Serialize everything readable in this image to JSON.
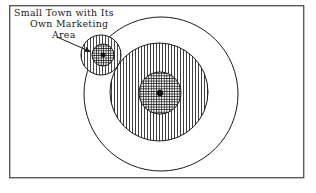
{
  "figure": {
    "background_color": "#ffffff",
    "ink_color": "#1a1a1a",
    "frame": {
      "label": "diagram-border",
      "x": 9,
      "y": 5,
      "width": 295,
      "height": 173,
      "stroke_color": "#5a5a5a",
      "stroke_width": 1.4
    },
    "annotation": {
      "lines": [
        "Small Town  with Its",
        "Own Marketing",
        "Area"
      ],
      "line_x": [
        14,
        30,
        52
      ],
      "line_y": [
        16,
        27,
        38
      ],
      "font_size": 9.4,
      "color": "#1a1a1a"
    },
    "leader_arrow": {
      "label": "pointer-arrow",
      "from_x": 57,
      "from_y": 37,
      "to_x": 93,
      "to_y": 53,
      "stroke_color": "#1a1a1a",
      "stroke_width": 1.0
    },
    "shapes": [
      {
        "name": "outer-trade-area-circle",
        "role": "outer marketing boundary",
        "cx": 161,
        "cy": 94,
        "r": 77,
        "fill": "none",
        "hatch": "none",
        "stroke_color": "#1a1a1a",
        "stroke_width": 1.0
      },
      {
        "name": "city-marketing-area-circle",
        "role": "vertically hatched marketing area of the city",
        "cx": 159,
        "cy": 92,
        "r": 49,
        "fill": "vertical-hatch",
        "hatch": "vertical",
        "hatch_spacing": 3.0,
        "stroke_color": "#1a1a1a",
        "stroke_width": 1.0
      },
      {
        "name": "city-core-circle",
        "role": "cross hatched built up city core",
        "cx": 160,
        "cy": 93,
        "r": 21,
        "fill": "cross-hatch",
        "hatch": "cross",
        "hatch_spacing": 2.6,
        "stroke_color": "#1a1a1a",
        "stroke_width": 1.0
      },
      {
        "name": "city-center-dot",
        "role": "city center point",
        "cx": 160,
        "cy": 93,
        "r": 3.2,
        "fill": "#111111",
        "hatch": "none",
        "stroke_color": "#111111",
        "stroke_width": 1.0
      },
      {
        "name": "small-town-marketing-area-circle",
        "role": "vertically hatched marketing area of the small town",
        "cx": 101,
        "cy": 55,
        "r": 20,
        "fill": "vertical-hatch",
        "hatch": "vertical",
        "hatch_spacing": 3.0,
        "stroke_color": "#1a1a1a",
        "stroke_width": 1.0
      },
      {
        "name": "small-town-core-circle",
        "role": "cross hatched small town core",
        "cx": 103,
        "cy": 55,
        "r": 11,
        "fill": "cross-hatch",
        "hatch": "cross",
        "hatch_spacing": 2.4,
        "stroke_color": "#1a1a1a",
        "stroke_width": 1.0
      },
      {
        "name": "small-town-center-dot",
        "role": "small town center point",
        "cx": 103,
        "cy": 55,
        "r": 2.4,
        "fill": "#111111",
        "hatch": "none",
        "stroke_color": "#111111",
        "stroke_width": 1.0
      }
    ]
  }
}
